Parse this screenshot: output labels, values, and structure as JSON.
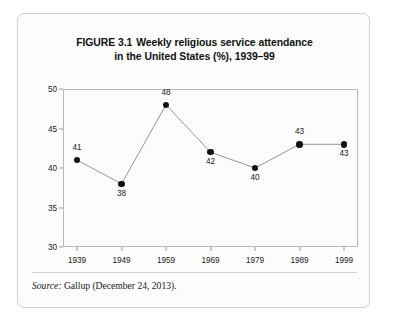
{
  "figure": {
    "title_line1_number": "FIGURE 3.1",
    "title_line1_text": "Weekly religious service attendance",
    "title_line2": "in the United States (%), 1939–99",
    "source_keyword": "Source:",
    "source_text": "Gallup (December 24, 2013)."
  },
  "chart_data": {
    "type": "line",
    "xlabel": "",
    "ylabel": "",
    "categories": [
      "1939",
      "1949",
      "1959",
      "1969",
      "1979",
      "1989",
      "1999"
    ],
    "values": [
      41,
      38,
      48,
      42,
      40,
      43,
      43
    ],
    "point_labels": [
      "41",
      "38",
      "48",
      "42",
      "40",
      "43",
      "43"
    ],
    "label_positions": [
      "above",
      "below",
      "above",
      "below",
      "below",
      "above",
      "below"
    ],
    "ylim": [
      30,
      50
    ],
    "yticks": [
      50,
      45,
      40,
      35,
      30
    ],
    "ytick_labels": [
      "50",
      "45",
      "40",
      "35",
      "30"
    ],
    "xtick_labels": [
      "1939",
      "1949",
      "1959",
      "1969",
      "1979",
      "1989",
      "1999"
    ],
    "grid": false,
    "legend": false,
    "marker": "circle",
    "marker_color": "#111111",
    "line_color": "#8a8a8a",
    "frame_color": "#b9b9b9",
    "background": "#fcfcfc"
  }
}
